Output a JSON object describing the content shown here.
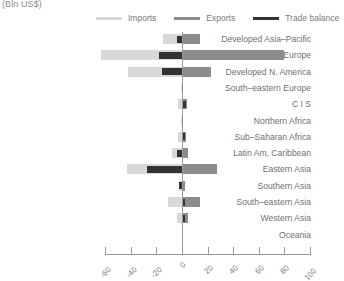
{
  "chart_data": {
    "type": "bar",
    "orientation": "horizontal",
    "title": "(Bln US$)",
    "xlabel": "",
    "ylabel": "",
    "xlim": [
      -60,
      100
    ],
    "xticks": [
      -60,
      -40,
      -20,
      0,
      20,
      40,
      60,
      80,
      100
    ],
    "grid": false,
    "legend_position": "top",
    "categories": [
      "Developed Asia–Pacific",
      "Developed Europe",
      "Developed N. America",
      "South–eastern Europe",
      "C I S",
      "Northern Africa",
      "Sub–Saharan Africa",
      "Latin Am, Caribbean",
      "Eastern Asia",
      "Southern Asia",
      "South–eastern Asia",
      "Western Asia",
      "Oceania"
    ],
    "series": [
      {
        "name": "Imports",
        "color": "#d8d8d8",
        "values": [
          -15,
          -63,
          -42,
          -1,
          -3,
          -1,
          -3,
          -8,
          -43,
          -2,
          -11,
          -4,
          0
        ]
      },
      {
        "name": "Exports",
        "color": "#8c8c8c",
        "values": [
          14,
          80,
          23,
          1,
          4,
          1,
          3,
          5,
          27,
          2,
          14,
          5,
          0
        ]
      },
      {
        "name": "Trade balance",
        "color": "#333333",
        "values": [
          -4,
          -18,
          -16,
          0,
          3,
          0,
          2,
          -4,
          -27,
          -2,
          2,
          2,
          0
        ]
      }
    ]
  },
  "legend": {
    "items": [
      {
        "label": "Imports",
        "color": "#d8d8d8"
      },
      {
        "label": "Exports",
        "color": "#8c8c8c"
      },
      {
        "label": "Trade balance",
        "color": "#333333"
      }
    ]
  },
  "axis": {
    "tick_labels": [
      "-60",
      "-40",
      "-20",
      "0",
      "20",
      "40",
      "60",
      "80",
      "100"
    ]
  }
}
